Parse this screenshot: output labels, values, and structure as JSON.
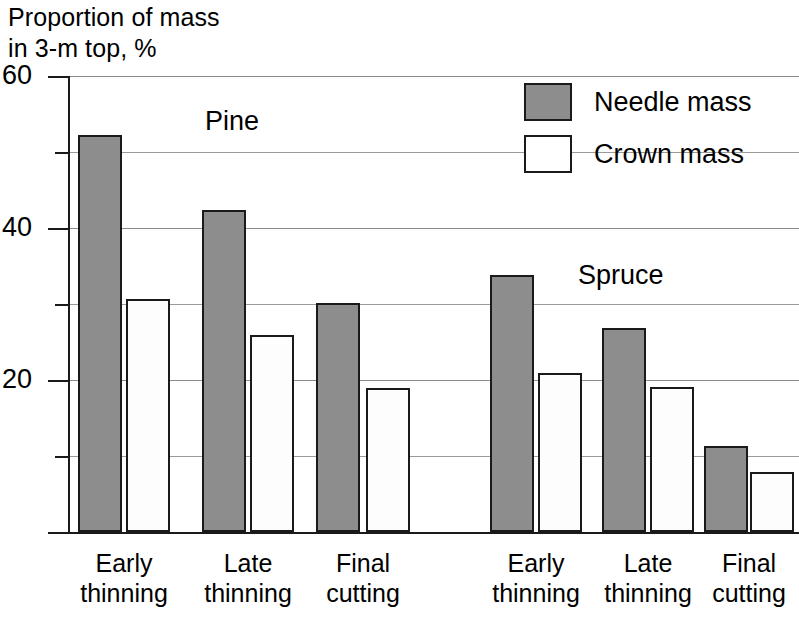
{
  "chart_data": {
    "type": "bar",
    "title": "",
    "ylabel": "Proportion of mass\nin 3-m top, %",
    "xlabel": "",
    "ylim": [
      0,
      60
    ],
    "yticks_major": [
      20,
      40,
      60
    ],
    "yticks_minor": [
      10,
      30,
      50
    ],
    "ytick_labels": [
      "20",
      "40",
      "60"
    ],
    "grid": true,
    "legend_position": "top-right",
    "categories": [
      "Early\nthinning",
      "Late\nthinning",
      "Final\ncutting",
      "Early\nthinning",
      "Late\nthinning",
      "Final\ncutting"
    ],
    "groups": [
      {
        "name": "Pine",
        "categories": [
          "Early\nthinning",
          "Late\nthinning",
          "Final\ncutting"
        ]
      },
      {
        "name": "Spruce",
        "categories": [
          "Early\nthinning",
          "Late\nthinning",
          "Final\ncutting"
        ]
      }
    ],
    "series": [
      {
        "name": "Needle mass",
        "color": "#8d8d8d",
        "values": [
          52.2,
          42.4,
          30.1,
          33.8,
          26.8,
          11.3
        ]
      },
      {
        "name": "Crown mass",
        "color": "#ffffff",
        "values": [
          30.6,
          25.9,
          18.9,
          20.9,
          19.1,
          7.9
        ]
      }
    ]
  },
  "axis_title": {
    "line1": "Proportion of mass",
    "line2": "in 3-m top, %"
  },
  "y_axis": {
    "labels": [
      "60",
      "40",
      "20"
    ]
  },
  "annotations": {
    "pine": "Pine",
    "spruce": "Spruce"
  },
  "legend": {
    "items": [
      {
        "label": "Needle mass",
        "swatch": "needle-mass-swatch"
      },
      {
        "label": "Crown mass",
        "swatch": "crown-mass-swatch"
      }
    ]
  },
  "x_axis": {
    "labels": [
      {
        "line1": "Early",
        "line2": "thinning"
      },
      {
        "line1": "Late",
        "line2": "thinning"
      },
      {
        "line1": "Final",
        "line2": "cutting"
      },
      {
        "line1": "Early",
        "line2": "thinning"
      },
      {
        "line1": "Late",
        "line2": "thinning"
      },
      {
        "line1": "Final",
        "line2": "cutting"
      }
    ]
  },
  "colors": {
    "needle_fill": "#8d8d8d",
    "crown_fill": "#ffffff",
    "outline": "#1a1a1a",
    "gridline": "#9a9a9a"
  }
}
